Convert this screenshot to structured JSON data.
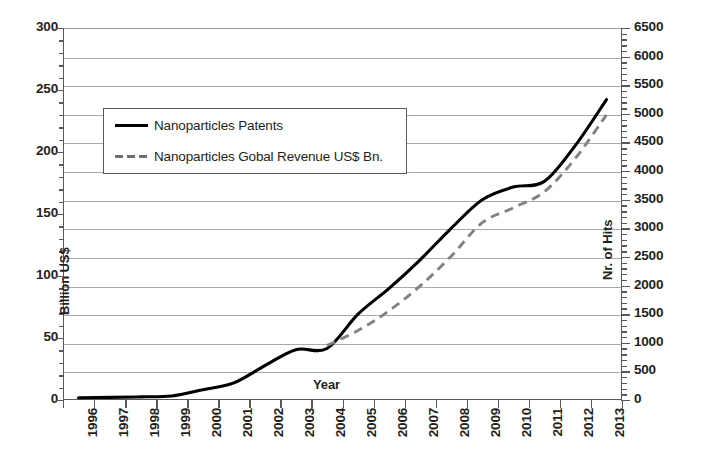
{
  "chart_data": {
    "type": "line",
    "title": "",
    "xlabel": "Year",
    "grid": true,
    "legend_position": "top-left-inside",
    "x": [
      1996,
      1997,
      1998,
      1999,
      2000,
      2001,
      2002,
      2003,
      2004,
      2005,
      2006,
      2007,
      2008,
      2009,
      2010,
      2011,
      2012,
      2013
    ],
    "x_tick_labels": [
      "1996",
      "1997",
      "1998",
      "1999",
      "2000",
      "2001",
      "2002",
      "2003",
      "2004",
      "2005",
      "2006",
      "2007",
      "2008",
      "2009",
      "2010",
      "2011",
      "2012",
      "2013"
    ],
    "axes": {
      "left": {
        "label": "Billion US$",
        "min": 0,
        "max": 300,
        "step": 50,
        "ticks": [
          300,
          250,
          200,
          150,
          100,
          50,
          0
        ],
        "tick_labels": [
          "300",
          "250",
          "200",
          "150",
          "100",
          "50",
          "0"
        ]
      },
      "right": {
        "label": "Nr. of Hits",
        "min": 0,
        "max": 6500,
        "step": 500,
        "ticks": [
          6500,
          6000,
          5500,
          5000,
          4500,
          4000,
          3500,
          3000,
          2500,
          2000,
          1500,
          1000,
          500,
          0
        ],
        "tick_labels": [
          "6500",
          "6000",
          "5500",
          "5000",
          "4500",
          "4000",
          "3500",
          "3000",
          "2500",
          "2000",
          "1500",
          "1000",
          "500",
          "0"
        ]
      }
    },
    "series": [
      {
        "name": "Nanoparticles Patents",
        "axis": "right",
        "unit": "Nr. of Hits",
        "style": "solid",
        "color": "#000000",
        "values": [
          40,
          45,
          55,
          70,
          180,
          300,
          600,
          880,
          900,
          1500,
          1950,
          2450,
          3000,
          3500,
          3720,
          3820,
          4450,
          5250
        ]
      },
      {
        "name": "Nanoparticles Gobal Revenue US$ Bn.",
        "axis": "left",
        "unit": "Billion US$",
        "style": "dashed",
        "color": "#808285",
        "values": [
          null,
          null,
          null,
          null,
          null,
          null,
          null,
          null,
          44,
          56,
          72,
          92,
          116,
          143,
          155,
          168,
          195,
          230
        ]
      }
    ]
  },
  "legend": {
    "entries": [
      {
        "label": "Nanoparticles Patents",
        "style": "solid"
      },
      {
        "label": "Nanoparticles Gobal Revenue US$ Bn.",
        "style": "dashed"
      }
    ]
  }
}
